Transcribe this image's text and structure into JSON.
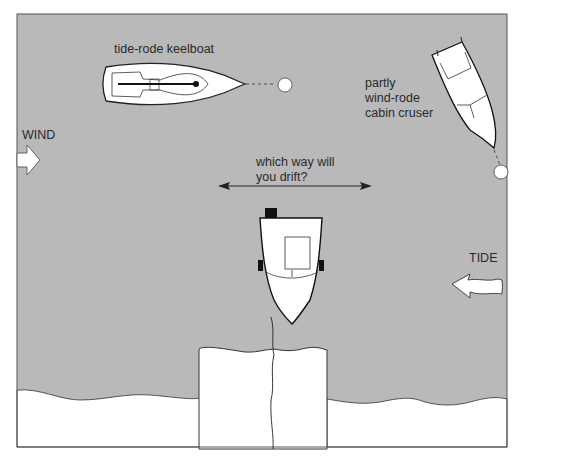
{
  "diagram": {
    "labels": {
      "keelboat": "tide-rode keelboat",
      "cruiser_line1": "partly",
      "cruiser_line2": "wind-rode",
      "cruiser_line3": "cabin cruser",
      "wind": "WIND",
      "question_line1": "which way will",
      "question_line2": "you drift?",
      "tide": "TIDE"
    },
    "colors": {
      "water": "#b9b9b9",
      "land": "#ffffff",
      "outline": "#222222",
      "text": "#2a2a2a"
    },
    "icons": {
      "wind_arrow": "wind-arrow-icon",
      "tide_arrow": "tide-arrow-icon",
      "drift_arrow": "double-arrow-icon",
      "mooring_buoy": "buoy-icon"
    }
  }
}
